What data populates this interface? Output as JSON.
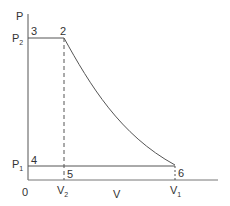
{
  "diagram": {
    "type": "pv-diagram",
    "axes": {
      "y_label": "P",
      "x_label": "V",
      "origin_label": "0"
    },
    "pressure_levels": [
      {
        "label": "P",
        "sub": "2"
      },
      {
        "label": "P",
        "sub": "1"
      }
    ],
    "volume_levels": [
      {
        "label": "V",
        "sub": "2"
      },
      {
        "label": "V",
        "sub": "1"
      }
    ],
    "points": [
      "3",
      "2",
      "4",
      "5",
      "6"
    ],
    "colors": {
      "line": "#555555",
      "text": "#333333"
    }
  }
}
